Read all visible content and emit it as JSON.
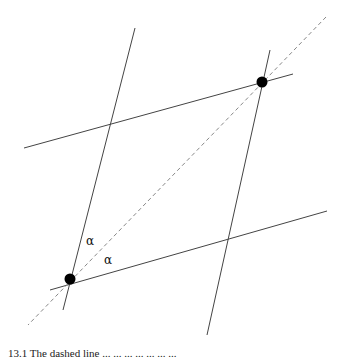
{
  "figure": {
    "lines": [
      {
        "id": "left-line",
        "x1": 135,
        "y1": 28,
        "x2": 63,
        "y2": 310,
        "style": "solid"
      },
      {
        "id": "right-line",
        "x1": 270,
        "y1": 50,
        "x2": 207,
        "y2": 335,
        "style": "solid"
      },
      {
        "id": "upper-line",
        "x1": 24,
        "y1": 148,
        "x2": 293,
        "y2": 74,
        "style": "solid"
      },
      {
        "id": "lower-line",
        "x1": 50,
        "y1": 290,
        "x2": 327,
        "y2": 211,
        "style": "solid"
      },
      {
        "id": "diagonal",
        "x1": 326,
        "y1": 17,
        "x2": 28,
        "y2": 325,
        "style": "dashed"
      }
    ],
    "points": [
      {
        "id": "lower-left-vertex",
        "cx": 70,
        "cy": 279
      },
      {
        "id": "upper-right-vertex",
        "cx": 262,
        "cy": 82
      }
    ],
    "labels": [
      {
        "id": "alpha-upper",
        "text": "α",
        "x": 86,
        "y": 245
      },
      {
        "id": "alpha-lower",
        "text": "α",
        "x": 104,
        "y": 264
      }
    ],
    "colors": {
      "line": "#444444",
      "dashed": "#888888",
      "point": "#000000"
    }
  },
  "caption": {
    "text": "13.1 The dashed line ... ... ... ... ... ... ..."
  }
}
